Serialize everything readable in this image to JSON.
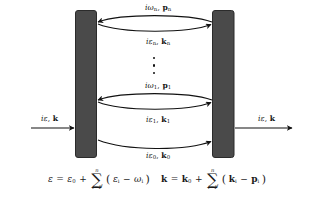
{
  "figure": {
    "name": "multi-boson-scattering-diagram",
    "background_color": "#ffffff",
    "ink_color": "#111111",
    "block_fill": "#4a4a4a",
    "block_stroke": "#2b2b2b"
  },
  "blocks": [
    {
      "id": "left-block",
      "label": ""
    },
    {
      "id": "right-block",
      "label": ""
    }
  ],
  "external_lines": {
    "incoming": {
      "label_i": "i",
      "label_eps": "ε",
      "comma": ",",
      "label_k": "k",
      "direction": "right"
    },
    "outgoing": {
      "label_i": "i",
      "label_eps": "ε",
      "comma": ",",
      "label_k": "k",
      "direction": "right"
    }
  },
  "internal_lines": [
    {
      "id": "boson-n",
      "energy_prefix": "i",
      "energy_symbol": "ω",
      "energy_sub": "n",
      "comma": ",",
      "momentum_symbol": "p",
      "momentum_sub": "n",
      "direction": "left"
    },
    {
      "id": "fermion-n",
      "energy_prefix": "i",
      "energy_symbol": "ε",
      "energy_sub": "n",
      "comma": ",",
      "momentum_symbol": "k",
      "momentum_sub": "n",
      "direction": "right"
    },
    {
      "id": "boson-1",
      "energy_prefix": "i",
      "energy_symbol": "ω",
      "energy_sub": "1",
      "comma": ",",
      "momentum_symbol": "p",
      "momentum_sub": "1",
      "direction": "left"
    },
    {
      "id": "fermion-1",
      "energy_prefix": "i",
      "energy_symbol": "ε",
      "energy_sub": "1",
      "comma": ",",
      "momentum_symbol": "k",
      "momentum_sub": "1",
      "direction": "right"
    },
    {
      "id": "fermion-0",
      "energy_prefix": "i",
      "energy_symbol": "ε",
      "energy_sub": "0",
      "comma": ",",
      "momentum_symbol": "k",
      "momentum_sub": "0",
      "direction": "right"
    }
  ],
  "ellipsis": {
    "glyph": "⋮",
    "dot_count": 3
  },
  "equations": {
    "energy": {
      "lhs": "ε",
      "equals": "=",
      "first_term": "ε",
      "first_sub": "0",
      "plus": "+",
      "sigma": "∑",
      "sigma_upper": "n",
      "sigma_lower": "i=1",
      "open_paren": "(",
      "term_a": "ε",
      "term_a_sub": "i",
      "minus": "−",
      "term_b": "ω",
      "term_b_sub": "i",
      "close_paren": ")"
    },
    "momentum": {
      "lhs": "k",
      "equals": "=",
      "first_term": "k",
      "first_sub": "0",
      "plus": "+",
      "sigma": "∑",
      "sigma_upper": "n",
      "sigma_lower": "i=1",
      "open_paren": "(",
      "term_a": "k",
      "term_a_sub": "i",
      "minus": "−",
      "term_b": "p",
      "term_b_sub": "i",
      "close_paren": ")"
    }
  }
}
